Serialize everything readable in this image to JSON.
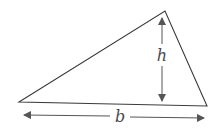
{
  "diagram": {
    "type": "triangle-area-figure",
    "colors": {
      "stroke": "#3c3c3c",
      "arrow": "#555555",
      "label": "#4a4a4a",
      "background": "#ffffff"
    },
    "triangle": {
      "vertices": [
        [
          19,
          102
        ],
        [
          165,
          11
        ],
        [
          207,
          106
        ]
      ]
    },
    "height": {
      "label": "h",
      "from": [
        162,
        17
      ],
      "to": [
        162,
        102
      ]
    },
    "base": {
      "label": "b",
      "from": [
        23,
        116
      ],
      "to": [
        205,
        118
      ]
    }
  }
}
